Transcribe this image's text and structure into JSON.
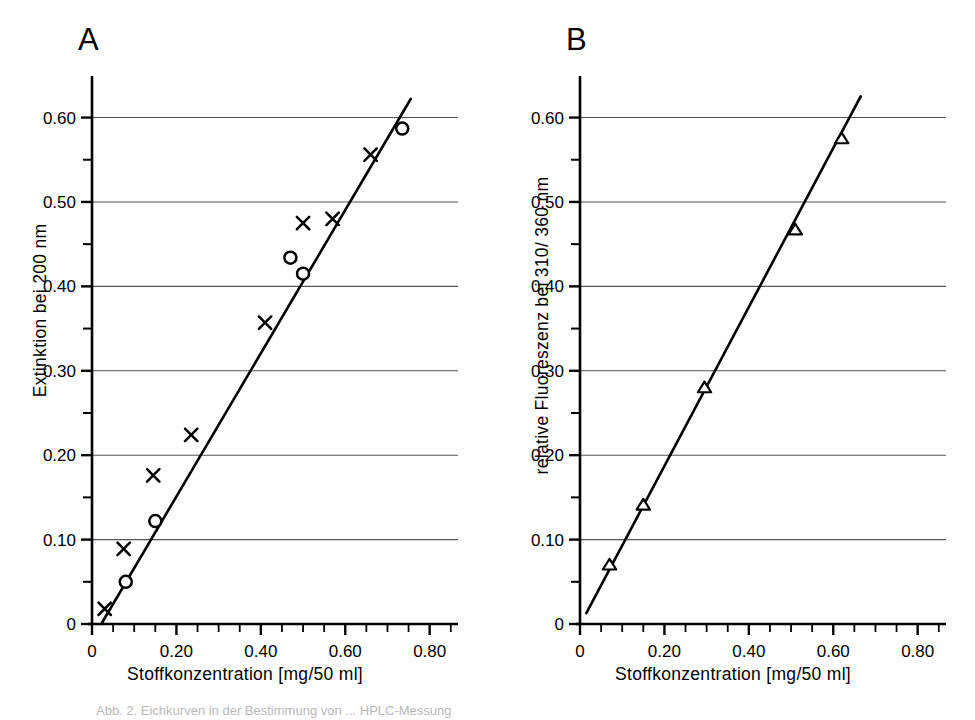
{
  "figure": {
    "width": 975,
    "height": 720,
    "background": "#ffffff",
    "ink": "#000000",
    "grid_color": "#555555",
    "caption_fragment": "Abb. 2. Eichkurven in der Bestimmung von ... HPLC-Messung"
  },
  "panels": [
    {
      "id": "A",
      "letter": "A",
      "xlabel": "Stoffkonzentration [mg/50 ml]",
      "ylabel": "Extinktion bei 200 nm",
      "x_ticks_major": [
        "0",
        "0.20",
        "0.40",
        "0.60",
        "0.80"
      ],
      "y_ticks_major": [
        "0",
        "0.10",
        "0.20",
        "0.30",
        "0.40",
        "0.50",
        "0.60"
      ]
    },
    {
      "id": "B",
      "letter": "B",
      "xlabel": "Stoffkonzentration [mg/50 ml]",
      "ylabel": "relative Fluoreszenz bei 310/ 360 nm",
      "x_ticks_major": [
        "0",
        "0.20",
        "0.40",
        "0.60",
        "0.80"
      ],
      "y_ticks_major": [
        "0",
        "0.10",
        "0.20",
        "0.30",
        "0.40",
        "0.50",
        "0.60"
      ]
    }
  ],
  "chart_data": [
    {
      "type": "scatter",
      "panel": "A",
      "title": "A",
      "xlabel": "Stoffkonzentration [mg/50 ml]",
      "ylabel": "Extinktion bei 200 nm",
      "xlim": [
        0,
        0.86
      ],
      "ylim": [
        0,
        0.635
      ],
      "x_major_ticks": [
        0,
        0.2,
        0.4,
        0.6,
        0.8
      ],
      "x_minor_step": 0.05,
      "y_major_ticks": [
        0,
        0.1,
        0.2,
        0.3,
        0.4,
        0.5,
        0.6
      ],
      "y_minor_step": 0.05,
      "grid": "horizontal-major-only",
      "legend": "none",
      "series": [
        {
          "name": "cross-series",
          "marker": "x",
          "points": [
            {
              "x": 0.03,
              "y": 0.018
            },
            {
              "x": 0.075,
              "y": 0.089
            },
            {
              "x": 0.145,
              "y": 0.176
            },
            {
              "x": 0.235,
              "y": 0.224
            },
            {
              "x": 0.41,
              "y": 0.357
            },
            {
              "x": 0.5,
              "y": 0.475
            },
            {
              "x": 0.57,
              "y": 0.48
            },
            {
              "x": 0.66,
              "y": 0.556
            }
          ]
        },
        {
          "name": "circle-series",
          "marker": "circle-open",
          "points": [
            {
              "x": 0.08,
              "y": 0.05
            },
            {
              "x": 0.15,
              "y": 0.122
            },
            {
              "x": 0.47,
              "y": 0.434
            },
            {
              "x": 0.5,
              "y": 0.415
            },
            {
              "x": 0.735,
              "y": 0.587
            }
          ]
        }
      ],
      "fit_line": {
        "x0": 0.022,
        "y0": 0.0,
        "x1": 0.755,
        "y1": 0.622
      }
    },
    {
      "type": "scatter",
      "panel": "B",
      "title": "B",
      "xlabel": "Stoffkonzentration [mg/50 ml]",
      "ylabel": "relative Fluoreszenz bei 310/ 360 nm",
      "xlim": [
        0,
        0.86
      ],
      "ylim": [
        0,
        0.635
      ],
      "x_major_ticks": [
        0,
        0.2,
        0.4,
        0.6,
        0.8
      ],
      "x_minor_step": 0.05,
      "y_major_ticks": [
        0,
        0.1,
        0.2,
        0.3,
        0.4,
        0.5,
        0.6
      ],
      "y_minor_step": 0.05,
      "grid": "horizontal-major-only",
      "legend": "none",
      "series": [
        {
          "name": "triangle-series",
          "marker": "triangle-open",
          "points": [
            {
              "x": 0.07,
              "y": 0.07
            },
            {
              "x": 0.15,
              "y": 0.141
            },
            {
              "x": 0.295,
              "y": 0.28
            },
            {
              "x": 0.51,
              "y": 0.467
            },
            {
              "x": 0.62,
              "y": 0.575
            }
          ]
        }
      ],
      "fit_line": {
        "x0": 0.015,
        "y0": 0.013,
        "x1": 0.665,
        "y1": 0.625
      }
    }
  ]
}
